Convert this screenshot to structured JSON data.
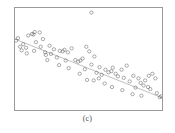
{
  "figure": {
    "caption": "(c)",
    "panel_label": "(c)",
    "background_color": "#ffffff",
    "frame_color": "#9a9a9a",
    "point_color": "#5a5a5a",
    "trendline_color": "#8c8c8c"
  },
  "chart_data": {
    "type": "scatter",
    "title": "",
    "subtitle": "",
    "xlabel": "",
    "ylabel": "",
    "xlim": [
      0,
      100
    ],
    "ylim": [
      0,
      100
    ],
    "grid": false,
    "legend": "none",
    "axis_ticks": "none",
    "marker": "open-circle",
    "marker_size": 2,
    "series": [
      {
        "name": "observations",
        "type": "scatter",
        "points": [
          [
            0.7,
            68.0
          ],
          [
            3.5,
            62.0
          ],
          [
            4.5,
            58.5
          ],
          [
            5.6,
            64.5
          ],
          [
            7.5,
            61.0
          ],
          [
            9.0,
            73.0
          ],
          [
            11.5,
            74.5
          ],
          [
            12.6,
            74.0
          ],
          [
            13.4,
            76.5
          ],
          [
            16.8,
            76.0
          ],
          [
            14.2,
            66.5
          ],
          [
            17.5,
            62.0
          ],
          [
            19.0,
            69.5
          ],
          [
            20.5,
            56.5
          ],
          [
            23.5,
            63.0
          ],
          [
            24.5,
            55.0
          ],
          [
            26.5,
            59.5
          ],
          [
            22.0,
            49.0
          ],
          [
            28.5,
            51.5
          ],
          [
            30.5,
            58.0
          ],
          [
            32.5,
            57.5
          ],
          [
            33.7,
            59.0
          ],
          [
            36.0,
            56.5
          ],
          [
            34.5,
            48.5
          ],
          [
            38.5,
            60.5
          ],
          [
            41.0,
            49.0
          ],
          [
            43.0,
            47.5
          ],
          [
            44.5,
            48.5
          ],
          [
            46.0,
            50.5
          ],
          [
            48.5,
            62.0
          ],
          [
            50.5,
            57.5
          ],
          [
            47.5,
            40.0
          ],
          [
            52.0,
            44.5
          ],
          [
            54.0,
            52.5
          ],
          [
            55.5,
            36.5
          ],
          [
            57.5,
            42.0
          ],
          [
            59.0,
            34.5
          ],
          [
            61.5,
            39.5
          ],
          [
            63.5,
            37.0
          ],
          [
            65.5,
            38.0
          ],
          [
            66.5,
            41.5
          ],
          [
            68.5,
            35.5
          ],
          [
            70.0,
            33.0
          ],
          [
            72.5,
            39.5
          ],
          [
            74.0,
            31.5
          ],
          [
            76.0,
            43.5
          ],
          [
            78.0,
            28.0
          ],
          [
            80.5,
            33.5
          ],
          [
            82.0,
            22.0
          ],
          [
            84.0,
            31.0
          ],
          [
            85.5,
            26.5
          ],
          [
            87.5,
            24.0
          ],
          [
            88.5,
            29.0
          ],
          [
            90.5,
            22.5
          ],
          [
            92.0,
            20.5
          ],
          [
            91.0,
            33.5
          ],
          [
            93.5,
            35.5
          ],
          [
            95.5,
            31.0
          ],
          [
            96.5,
            16.5
          ],
          [
            86.0,
            14.0
          ],
          [
            80.0,
            15.5
          ],
          [
            98.5,
            12.5
          ],
          [
            99.5,
            13.5
          ],
          [
            61.0,
            26.0
          ],
          [
            66.0,
            22.5
          ],
          [
            53.5,
            29.0
          ],
          [
            36.5,
            41.0
          ],
          [
            30.0,
            44.0
          ],
          [
            21.0,
            54.0
          ],
          [
            13.0,
            58.0
          ],
          [
            8.0,
            55.5
          ],
          [
            2.0,
            70.5
          ],
          [
            44.0,
            35.5
          ],
          [
            49.0,
            29.5
          ],
          [
            57.0,
            31.0
          ],
          [
            73.0,
            19.5
          ]
        ]
      },
      {
        "name": "outlier",
        "type": "scatter",
        "points": [
          [
            52.0,
            95.5
          ]
        ]
      }
    ],
    "trendline": {
      "name": "fitted-line",
      "type": "line",
      "x": [
        0,
        100
      ],
      "y": [
        69.5,
        12.0
      ],
      "slope": -0.575,
      "intercept": 69.5
    }
  }
}
